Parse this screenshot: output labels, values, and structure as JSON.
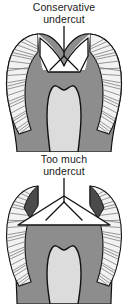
{
  "figure": {
    "name": "tooth-cavity-preparation-comparison",
    "background_color": "#ffffff",
    "width": 128,
    "height": 304
  },
  "panels": [
    {
      "id": "conservative",
      "caption": "Conservative\nundercut",
      "caption_line1": "Conservative",
      "caption_line2": "undercut",
      "diagram_name": "tooth-cross-section-conservative-undercut",
      "description": "Cross-section of a tooth showing a narrow V-shaped cavity preparation confined between the cusps",
      "cavity_shape": "narrow-v-notch",
      "leader_line": "y-shaped-pointer"
    },
    {
      "id": "excessive",
      "caption": "Too much\nundercut",
      "caption_line1": "Too much",
      "caption_line2": "undercut",
      "diagram_name": "tooth-cross-section-too-much-undercut",
      "description": "Cross-section of a tooth showing a wide flat-based triangular cavity preparation undermining both cusps",
      "cavity_shape": "wide-triangular-undercut",
      "leader_line": "y-shaped-pointer"
    }
  ],
  "legend_colors": {
    "enamel_hatch_fill": "#f2f2f2",
    "enamel_hatch_line": "#6d6d6d",
    "dentin": "#8d8d8d",
    "pulp": "#dcdcdc",
    "outline": "#111111",
    "cavity_fill": "#ffffff",
    "caption_text": "#1a1a1a"
  },
  "structures": [
    {
      "name": "enamel-left",
      "label": "Enamel (hatched)"
    },
    {
      "name": "enamel-right",
      "label": "Enamel (hatched)"
    },
    {
      "name": "dentin",
      "label": "Dentin"
    },
    {
      "name": "pulp-chamber",
      "label": "Pulp chamber"
    },
    {
      "name": "cavity-preparation",
      "label": "Cavity preparation"
    }
  ]
}
